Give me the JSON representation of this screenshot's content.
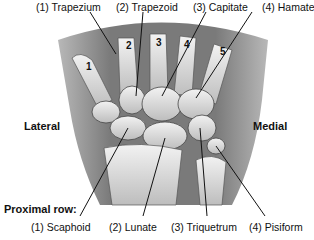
{
  "distal_labels": [
    {
      "num": "(1)",
      "name": "Trapezium",
      "text": "(1) Trapezium"
    },
    {
      "num": "(2)",
      "name": "Trapezoid",
      "text": "(2) Trapezoid"
    },
    {
      "num": "(3)",
      "name": "Capitate",
      "text": "(3) Capitate"
    },
    {
      "num": "(4)",
      "name": "Hamate",
      "text": "(4) Hamate"
    }
  ],
  "proximal_row_title": "Proximal row:",
  "proximal_labels": [
    {
      "text": "(1) Scaphoid"
    },
    {
      "text": "(2) Lunate"
    },
    {
      "text": "(3) Triquetrum"
    },
    {
      "text": "(4) Pisiform"
    }
  ],
  "sides": {
    "left": "Lateral",
    "right": "Medial"
  },
  "metacarpal_numbers": [
    "1",
    "2",
    "3",
    "4",
    "5"
  ],
  "colors": {
    "skin": "#8a8a8a",
    "skin_dark": "#6e6e6e",
    "bone": "#e6e6e6",
    "bone_shade": "#c4c4c4",
    "line": "#222222"
  }
}
